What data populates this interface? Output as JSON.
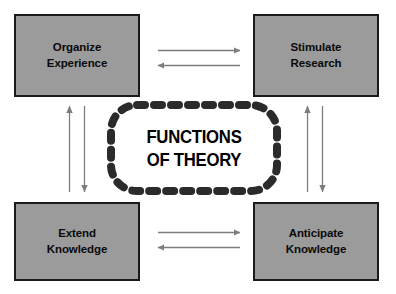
{
  "diagram": {
    "title": "FUNCTIONS\nOF THEORY",
    "center": {
      "label": "FUNCTIONS\nOF THEORY",
      "shape": "dashed-rounded-rectangle",
      "border_color": "#2b2b2b",
      "text_color": "#000000"
    },
    "nodes": [
      {
        "id": "organize-experience",
        "label": "Organize\nExperience",
        "position": "top-left",
        "fill_color": "#9b9b9b",
        "border_color": "#1a1a1a",
        "text_color": "#0a0a0a"
      },
      {
        "id": "stimulate-research",
        "label": "Stimulate\nResearch",
        "position": "top-right",
        "fill_color": "#9b9b9b",
        "border_color": "#1a1a1a",
        "text_color": "#0a0a0a"
      },
      {
        "id": "extend-knowledge",
        "label": "Extend\nKnowledge",
        "position": "bottom-left",
        "fill_color": "#9b9b9b",
        "border_color": "#1a1a1a",
        "text_color": "#0a0a0a"
      },
      {
        "id": "anticipate-knowledge",
        "label": "Anticipate\nKnowledge",
        "position": "bottom-right",
        "fill_color": "#9b9b9b",
        "border_color": "#1a1a1a",
        "text_color": "#0a0a0a"
      }
    ],
    "connectors": [
      {
        "id": "top-rightward",
        "from": "organize-experience",
        "to": "stimulate-research",
        "direction": "right",
        "color": "#7d7d7d"
      },
      {
        "id": "top-leftward",
        "from": "stimulate-research",
        "to": "organize-experience",
        "direction": "left",
        "color": "#7d7d7d"
      },
      {
        "id": "bottom-rightward",
        "from": "extend-knowledge",
        "to": "anticipate-knowledge",
        "direction": "right",
        "color": "#7d7d7d"
      },
      {
        "id": "bottom-leftward",
        "from": "anticipate-knowledge",
        "to": "extend-knowledge",
        "direction": "left",
        "color": "#7d7d7d"
      },
      {
        "id": "left-upward",
        "from": "extend-knowledge",
        "to": "organize-experience",
        "direction": "up",
        "color": "#7d7d7d"
      },
      {
        "id": "left-downward",
        "from": "organize-experience",
        "to": "extend-knowledge",
        "direction": "down",
        "color": "#7d7d7d"
      },
      {
        "id": "right-upward",
        "from": "anticipate-knowledge",
        "to": "stimulate-research",
        "direction": "up",
        "color": "#7d7d7d"
      },
      {
        "id": "right-downward",
        "from": "stimulate-research",
        "to": "anticipate-knowledge",
        "direction": "down",
        "color": "#7d7d7d"
      }
    ],
    "background_color": "#ffffff"
  }
}
